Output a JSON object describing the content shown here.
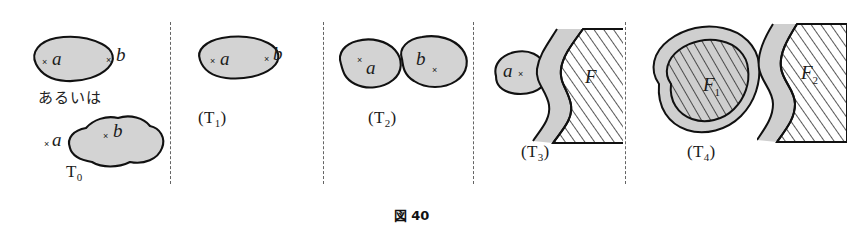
{
  "figure": {
    "caption": "図 40",
    "caption_number": "40",
    "panel_count": 5
  },
  "colors": {
    "blob_fill": "#d3d3d3",
    "outline": "#111111",
    "divider": "#4a4a4a",
    "hatch_line": "#111111",
    "background": "#ffffff"
  },
  "panels": [
    {
      "id": "T0",
      "label": "T",
      "label_sub": "0",
      "label_parenthesized": false,
      "connector_text": "あるいは",
      "variants": [
        {
          "region_label": "a",
          "region_point": "×",
          "outside_label": "b",
          "outside_point": "×"
        },
        {
          "region_label": "b",
          "region_point": "×",
          "outside_label": "a",
          "outside_point": "×"
        }
      ]
    },
    {
      "id": "T1",
      "label": "(T",
      "label_sub": "1",
      "label_parenthesized": true,
      "region_label": "a",
      "region_point": "×",
      "outside_label": "b",
      "outside_point": "×"
    },
    {
      "id": "T2",
      "label": "(T",
      "label_sub": "2",
      "label_parenthesized": true,
      "region_a_label": "a",
      "region_a_point": "×",
      "region_b_label": "b",
      "region_b_point": "×"
    },
    {
      "id": "T3",
      "label": "(T",
      "label_sub": "3",
      "label_parenthesized": true,
      "point_label": "a",
      "point_mark": "×",
      "closed_set_label": "F"
    },
    {
      "id": "T4",
      "label": "(T",
      "label_sub": "4",
      "label_parenthesized": true,
      "closed_set_1_label": "F",
      "closed_set_1_sub": "1",
      "closed_set_2_label": "F",
      "closed_set_2_sub": "2"
    }
  ],
  "dividers": [
    {
      "x": 170
    },
    {
      "x": 323
    },
    {
      "x": 473
    },
    {
      "x": 625
    }
  ]
}
